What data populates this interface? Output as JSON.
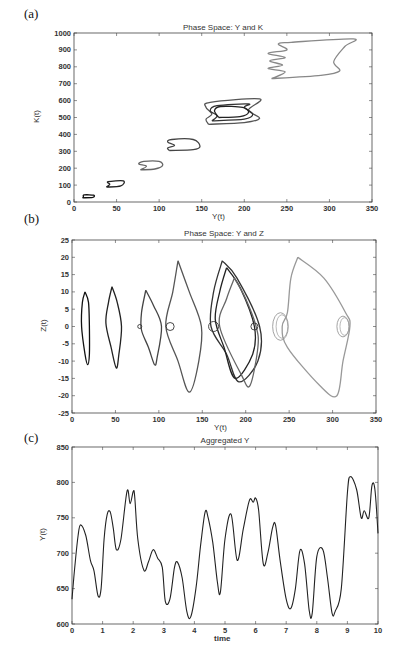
{
  "panels": {
    "a": {
      "label": "(a)",
      "title": "Phase Space: Y and K",
      "xlabel": "Y(t)",
      "ylabel": "K(t)"
    },
    "b": {
      "label": "(b)",
      "title": "Phase Space: Y and Z",
      "xlabel": "Y(t)",
      "ylabel": "Z(t)"
    },
    "c": {
      "label": "(c)",
      "title": "Aggregated Y",
      "xlabel": "time",
      "ylabel": "Y(t)"
    }
  },
  "chart_data": [
    {
      "type": "line",
      "title": "Phase Space: Y and K",
      "xlabel": "Y(t)",
      "ylabel": "K(t)",
      "xlim": [
        0,
        350
      ],
      "ylim": [
        0,
        1000
      ],
      "xticks": [
        0,
        50,
        100,
        150,
        200,
        250,
        300,
        350
      ],
      "yticks": [
        0,
        100,
        200,
        300,
        400,
        500,
        600,
        700,
        800,
        900,
        1000
      ],
      "grid": false,
      "series": [
        {
          "name": "loop1",
          "color": "#111111",
          "points": [
            [
              10,
              25
            ],
            [
              22,
              28
            ],
            [
              23,
              40
            ],
            [
              12,
              42
            ],
            [
              11,
              30
            ],
            [
              10,
              25
            ]
          ]
        },
        {
          "name": "loop2",
          "color": "#222222",
          "points": [
            [
              38,
              88
            ],
            [
              55,
              95
            ],
            [
              58,
              125
            ],
            [
              40,
              120
            ],
            [
              42,
              105
            ],
            [
              38,
              88
            ]
          ]
        },
        {
          "name": "loop3",
          "color": "#666666",
          "points": [
            [
              78,
              190
            ],
            [
              95,
              195
            ],
            [
              104,
              215
            ],
            [
              100,
              240
            ],
            [
              82,
              240
            ],
            [
              76,
              225
            ],
            [
              85,
              212
            ],
            [
              78,
              190
            ]
          ]
        },
        {
          "name": "loop4",
          "color": "#444444",
          "points": [
            [
              112,
              305
            ],
            [
              140,
              310
            ],
            [
              148,
              330
            ],
            [
              140,
              370
            ],
            [
              115,
              370
            ],
            [
              110,
              355
            ],
            [
              118,
              335
            ],
            [
              110,
              320
            ],
            [
              112,
              305
            ]
          ]
        },
        {
          "name": "loop5a",
          "color": "#555555",
          "points": [
            [
              158,
              460
            ],
            [
              200,
              470
            ],
            [
              218,
              495
            ],
            [
              205,
              545
            ],
            [
              218,
              610
            ],
            [
              160,
              590
            ],
            [
              155,
              560
            ],
            [
              162,
              520
            ],
            [
              155,
              490
            ],
            [
              158,
              460
            ]
          ]
        },
        {
          "name": "loop5b",
          "color": "#333333",
          "points": [
            [
              162,
              480
            ],
            [
              200,
              490
            ],
            [
              210,
              520
            ],
            [
              200,
              560
            ],
            [
              205,
              580
            ],
            [
              168,
              570
            ],
            [
              160,
              540
            ],
            [
              168,
              510
            ],
            [
              162,
              480
            ]
          ]
        },
        {
          "name": "loop5c",
          "color": "#222222",
          "points": [
            [
              170,
              500
            ],
            [
              195,
              505
            ],
            [
              205,
              530
            ],
            [
              198,
              560
            ],
            [
              172,
              565
            ],
            [
              165,
              540
            ],
            [
              170,
              500
            ]
          ]
        },
        {
          "name": "loop6",
          "color": "#888888",
          "points": [
            [
              232,
              730
            ],
            [
              290,
              750
            ],
            [
              312,
              775
            ],
            [
              305,
              830
            ],
            [
              318,
              920
            ],
            [
              328,
              965
            ],
            [
              255,
              945
            ],
            [
              240,
              935
            ],
            [
              250,
              900
            ],
            [
              228,
              880
            ],
            [
              248,
              855
            ],
            [
              230,
              835
            ],
            [
              245,
              810
            ],
            [
              228,
              790
            ],
            [
              248,
              770
            ],
            [
              232,
              730
            ]
          ]
        }
      ]
    },
    {
      "type": "line",
      "title": "Phase Space: Y and Z",
      "xlabel": "Y(t)",
      "ylabel": "Z(t)",
      "xlim": [
        0,
        350
      ],
      "ylim": [
        -25,
        25
      ],
      "xticks": [
        0,
        50,
        100,
        150,
        200,
        250,
        300,
        350
      ],
      "yticks": [
        -25,
        -20,
        -15,
        -10,
        -5,
        0,
        5,
        10,
        15,
        20,
        25
      ],
      "grid": false,
      "series": [
        {
          "name": "orbit1",
          "color": "#111111",
          "points": [
            [
              15,
              10
            ],
            [
              19,
              7
            ],
            [
              20,
              0
            ],
            [
              20,
              -8
            ],
            [
              18,
              -11
            ],
            [
              15,
              -8
            ],
            [
              11,
              0
            ],
            [
              12,
              7
            ],
            [
              15,
              10
            ]
          ]
        },
        {
          "name": "orbit2",
          "color": "#222222",
          "points": [
            [
              46,
              11.5
            ],
            [
              52,
              7
            ],
            [
              57,
              0
            ],
            [
              54,
              -8
            ],
            [
              51,
              -12
            ],
            [
              45,
              -6
            ],
            [
              39,
              1
            ],
            [
              42,
              7
            ],
            [
              46,
              11.5
            ]
          ]
        },
        {
          "name": "orbit3",
          "color": "#444444",
          "points": [
            [
              85,
              10.5
            ],
            [
              94,
              6
            ],
            [
              103,
              0
            ],
            [
              98,
              -9
            ],
            [
              95,
              -11
            ],
            [
              88,
              -6
            ],
            [
              80,
              -1
            ],
            [
              80,
              4
            ],
            [
              85,
              10.5
            ]
          ]
        },
        {
          "name": "orbit4",
          "color": "#555555",
          "points": [
            [
              122,
              19
            ],
            [
              135,
              10
            ],
            [
              149,
              0
            ],
            [
              146,
              -10
            ],
            [
              135,
              -19
            ],
            [
              122,
              -10
            ],
            [
              108,
              0
            ],
            [
              116,
              10
            ],
            [
              122,
              19
            ]
          ]
        },
        {
          "name": "orbit5a",
          "color": "#333333",
          "points": [
            [
              173,
              19
            ],
            [
              190,
              14
            ],
            [
              216,
              0
            ],
            [
              214,
              -10
            ],
            [
              192,
              -16
            ],
            [
              178,
              -8
            ],
            [
              160,
              0
            ],
            [
              163,
              10
            ],
            [
              173,
              19
            ]
          ]
        },
        {
          "name": "orbit5b",
          "color": "#222222",
          "points": [
            [
              178,
              17
            ],
            [
              194,
              11
            ],
            [
              210,
              0
            ],
            [
              208,
              -8
            ],
            [
              188,
              -15
            ],
            [
              175,
              -6
            ],
            [
              165,
              2
            ],
            [
              170,
              10
            ],
            [
              178,
              17
            ]
          ]
        },
        {
          "name": "orbit5c",
          "color": "#666666",
          "points": [
            [
              187,
              14
            ],
            [
              200,
              8
            ],
            [
              212,
              0
            ],
            [
              214,
              -6
            ],
            [
              205,
              -17
            ],
            [
              195,
              -14
            ],
            [
              170,
              0
            ],
            [
              178,
              8
            ],
            [
              187,
              14
            ]
          ]
        },
        {
          "name": "orbit6",
          "color": "#999999",
          "points": [
            [
              260,
              20
            ],
            [
              290,
              14
            ],
            [
              315,
              4
            ],
            [
              320,
              0
            ],
            [
              312,
              -10
            ],
            [
              305,
              -20
            ],
            [
              285,
              -17
            ],
            [
              248,
              -6
            ],
            [
              242,
              0
            ],
            [
              248,
              4
            ],
            [
              252,
              14
            ],
            [
              260,
              20
            ]
          ]
        },
        {
          "name": "ring1",
          "color": "#999999",
          "circle": [
            240,
            0,
            9,
            4
          ]
        },
        {
          "name": "ring2",
          "color": "#999999",
          "circle": [
            312,
            0,
            7,
            3
          ]
        }
      ]
    },
    {
      "type": "line",
      "title": "Aggregated Y",
      "xlabel": "time",
      "ylabel": "Y(t)",
      "xlim": [
        0,
        10
      ],
      "ylim": [
        600,
        850
      ],
      "xticks": [
        0,
        1,
        2,
        3,
        4,
        5,
        6,
        7,
        8,
        9,
        10
      ],
      "yticks": [
        600,
        650,
        700,
        750,
        800,
        850
      ],
      "grid": false,
      "series": [
        {
          "name": "Y",
          "color": "#222222",
          "x": [
            0,
            0.1,
            0.2,
            0.28,
            0.45,
            0.6,
            0.72,
            0.85,
            0.95,
            1.05,
            1.15,
            1.25,
            1.35,
            1.45,
            1.6,
            1.8,
            1.9,
            2.0,
            2.05,
            2.15,
            2.35,
            2.5,
            2.65,
            2.8,
            2.95,
            3.05,
            3.2,
            3.35,
            3.45,
            3.6,
            3.75,
            3.88,
            4.05,
            4.2,
            4.35,
            4.45,
            4.6,
            4.75,
            4.85,
            5.0,
            5.2,
            5.4,
            5.6,
            5.8,
            5.92,
            6.0,
            6.1,
            6.25,
            6.4,
            6.55,
            6.65,
            6.8,
            7.0,
            7.15,
            7.3,
            7.45,
            7.6,
            7.75,
            7.85,
            8.0,
            8.2,
            8.35,
            8.5,
            8.6,
            8.8,
            9.0,
            9.1,
            9.3,
            9.45,
            9.55,
            9.7,
            9.8,
            9.9,
            10.0
          ],
          "values": [
            635,
            685,
            725,
            740,
            725,
            690,
            675,
            640,
            650,
            720,
            755,
            758,
            735,
            705,
            720,
            788,
            770,
            787,
            780,
            720,
            676,
            688,
            705,
            693,
            680,
            632,
            635,
            680,
            687,
            665,
            618,
            610,
            650,
            710,
            758,
            750,
            715,
            660,
            645,
            720,
            755,
            690,
            735,
            775,
            772,
            778,
            760,
            685,
            700,
            735,
            740,
            690,
            635,
            622,
            650,
            704,
            685,
            620,
            615,
            695,
            705,
            665,
            615,
            618,
            650,
            785,
            808,
            790,
            750,
            760,
            750,
            795,
            790,
            728
          ]
        }
      ]
    }
  ]
}
